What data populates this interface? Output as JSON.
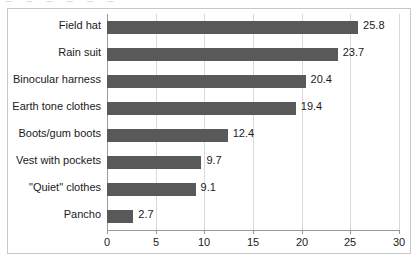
{
  "chart_data": {
    "type": "bar",
    "orientation": "horizontal",
    "title": "",
    "xlabel": "",
    "ylabel": "",
    "xlim": [
      0,
      30
    ],
    "xticks": [
      0,
      5,
      10,
      15,
      20,
      25,
      30
    ],
    "xtick_labels": [
      "0",
      "5",
      "10",
      "15",
      "20",
      "25",
      "30"
    ],
    "grid": "vertical",
    "legend": "none",
    "bar_color": "#595959",
    "gridline_color": "#d9d9d9",
    "axis_color": "#9a9a9a",
    "border_color": "#c8c8c8",
    "categories": [
      "Field hat",
      "Rain suit",
      "Binocular harness",
      "Earth tone clothes",
      "Boots/gum boots",
      "Vest with pockets",
      "\"Quiet\" clothes",
      "Pancho"
    ],
    "values": [
      25.8,
      23.7,
      20.4,
      19.4,
      12.4,
      9.7,
      9.1,
      2.7
    ],
    "data_labels": [
      "25.8",
      "23.7",
      "20.4",
      "19.4",
      "12.4",
      "9.7",
      "9.1",
      "2.7"
    ]
  },
  "artifact": {
    "ghost_text": "_ _ _ _ _ _"
  }
}
